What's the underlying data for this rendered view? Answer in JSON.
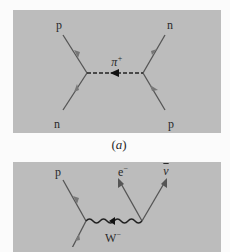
{
  "figure": {
    "panel_a": {
      "caption": "(a)",
      "caption_letter": "a",
      "exchange_particle": {
        "symbol": "π",
        "charge": "+",
        "line_style": "dashed"
      },
      "particles": {
        "top_left": "p",
        "bottom_left": "n",
        "top_right": "n",
        "bottom_right": "p"
      }
    },
    "panel_b": {
      "exchange_particle": {
        "symbol": "W",
        "charge": "−",
        "line_style": "wavy"
      },
      "particles": {
        "top_left": "p",
        "top_middle": {
          "symbol": "e",
          "charge": "−"
        },
        "top_right": {
          "symbol": "ν",
          "bar": true
        }
      }
    },
    "colors": {
      "page_background": "#fbfbfb",
      "panel_background": "#bcbcbc",
      "line_color": "#555555",
      "arrow_color": "#777777",
      "exchange_line_color": "#222222"
    }
  }
}
